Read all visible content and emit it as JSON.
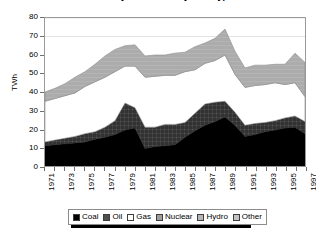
{
  "title": "Electricity Generation by Fuel Type",
  "axis": {
    "y_title": "TWh",
    "y_ticks": [
      "0",
      "10",
      "20",
      "30",
      "40",
      "50",
      "60",
      "70",
      "80"
    ],
    "y_min": 0,
    "y_max": 80,
    "x_ticks": [
      "1971",
      "1973",
      "1975",
      "1977",
      "1979",
      "1981",
      "1983",
      "1985",
      "1987",
      "1989",
      "1991",
      "1993",
      "1995",
      "1997"
    ]
  },
  "legend": {
    "items": [
      {
        "label": "Coal",
        "swatch": "coal-swatch"
      },
      {
        "label": "Oil",
        "swatch": "oil-swatch"
      },
      {
        "label": "Gas",
        "swatch": "gas-swatch"
      },
      {
        "label": "Nuclear",
        "swatch": "nuclear-swatch"
      },
      {
        "label": "Hydro",
        "swatch": "hydro-swatch"
      },
      {
        "label": "Other",
        "swatch": "other-swatch"
      }
    ]
  },
  "colors": {
    "coal": "#000000",
    "oil": "#4a4a4a",
    "gas": "#ffffff",
    "nuclear": "#b0b0b0",
    "hydro": "#a8a8a8",
    "other": "#c8c8c8",
    "frame": "#9a9a9a",
    "gridline": "#c9c9c9",
    "text": "#000000"
  },
  "chart_data": {
    "type": "area",
    "stacked": true,
    "title": "Electricity Generation by Fuel Type",
    "xlabel": "",
    "ylabel": "TWh",
    "ylim": [
      0,
      80
    ],
    "grid": false,
    "legend_position": "bottom",
    "x": [
      1971,
      1972,
      1973,
      1974,
      1975,
      1976,
      1977,
      1978,
      1979,
      1980,
      1981,
      1982,
      1983,
      1984,
      1985,
      1986,
      1987,
      1988,
      1989,
      1990,
      1991,
      1992,
      1993,
      1994,
      1995,
      1996,
      1997
    ],
    "series": [
      {
        "name": "Coal",
        "values": [
          11.0,
          11.5,
          12.0,
          12.5,
          13.0,
          14.5,
          15.5,
          17.0,
          19.5,
          20.5,
          9.5,
          10.5,
          11.0,
          11.5,
          15.5,
          19.0,
          22.0,
          24.0,
          26.5,
          22.0,
          16.0,
          17.0,
          18.5,
          19.5,
          20.5,
          21.0,
          17.5
        ]
      },
      {
        "name": "Oil",
        "values": [
          2.0,
          2.5,
          3.0,
          3.5,
          4.5,
          4.0,
          5.5,
          7.5,
          14.5,
          11.0,
          11.5,
          10.5,
          11.5,
          11.0,
          8.0,
          9.5,
          11.5,
          10.5,
          8.5,
          7.0,
          6.0,
          6.0,
          5.0,
          5.0,
          5.5,
          6.0,
          6.5
        ]
      },
      {
        "name": "Gas",
        "values": [
          22.0,
          22.5,
          23.0,
          23.5,
          25.5,
          27.0,
          27.0,
          26.5,
          20.0,
          22.5,
          27.0,
          27.5,
          26.5,
          26.5,
          27.5,
          23.5,
          22.0,
          22.5,
          25.0,
          20.5,
          20.5,
          20.5,
          20.5,
          20.5,
          18.0,
          18.0,
          13.5
        ]
      },
      {
        "name": "Nuclear",
        "values": [
          0.0,
          0.0,
          0.0,
          0.0,
          0.0,
          0.0,
          0.0,
          0.0,
          0.0,
          0.0,
          0.0,
          0.0,
          0.0,
          0.0,
          0.0,
          0.0,
          0.0,
          0.0,
          0.0,
          0.0,
          0.0,
          0.0,
          0.0,
          0.0,
          0.0,
          0.0,
          0.0
        ]
      },
      {
        "name": "Hydro",
        "values": [
          0.0,
          0.0,
          0.0,
          0.0,
          0.0,
          0.0,
          0.0,
          0.0,
          0.0,
          0.0,
          0.0,
          0.0,
          0.0,
          0.0,
          0.0,
          0.0,
          0.0,
          0.0,
          0.0,
          0.0,
          0.0,
          0.0,
          0.0,
          0.0,
          0.0,
          0.0,
          0.0
        ]
      },
      {
        "name": "Other",
        "values": [
          5.0,
          5.5,
          6.5,
          8.5,
          8.0,
          9.5,
          11.5,
          12.0,
          11.0,
          11.5,
          11.5,
          11.5,
          11.0,
          12.0,
          10.5,
          12.5,
          11.0,
          12.0,
          14.0,
          12.5,
          10.5,
          11.0,
          10.5,
          10.0,
          11.0,
          16.0,
          18.5
        ]
      }
    ]
  }
}
